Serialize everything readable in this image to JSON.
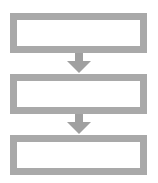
{
  "diagram": {
    "type": "flowchart",
    "boxes": [
      {
        "label": ""
      },
      {
        "label": ""
      },
      {
        "label": ""
      }
    ],
    "arrows": [
      {
        "from": 0,
        "to": 1
      },
      {
        "from": 1,
        "to": 2
      }
    ],
    "colors": {
      "border": "#a9a9a9",
      "arrow": "#a0a0a0",
      "fill": "#ffffff"
    }
  }
}
